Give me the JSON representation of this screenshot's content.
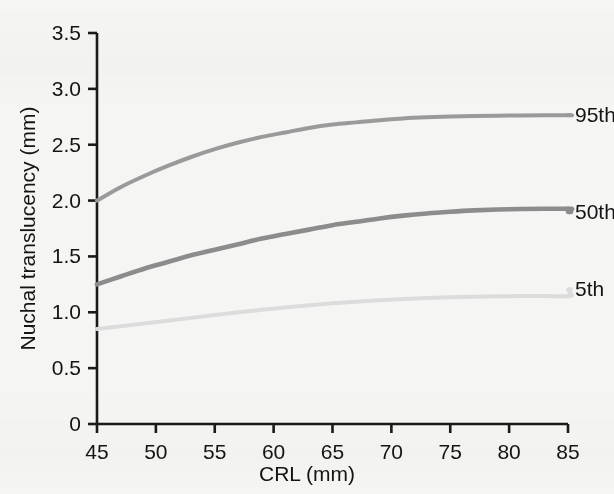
{
  "chart_data": {
    "type": "line",
    "title": "",
    "xlabel": "CRL (mm)",
    "ylabel": "Nuchal translucency (mm)",
    "xlim": [
      45,
      85
    ],
    "ylim": [
      0,
      3.5
    ],
    "xticks": [
      "45",
      "50",
      "55",
      "60",
      "65",
      "70",
      "75",
      "80",
      "85"
    ],
    "yticks": [
      "0",
      "0.5",
      "1.0",
      "1.5",
      "2.0",
      "2.5",
      "3.0",
      "3.5"
    ],
    "xtick_values": [
      45,
      50,
      55,
      60,
      65,
      70,
      75,
      80,
      85
    ],
    "ytick_values": [
      0,
      0.5,
      1.0,
      1.5,
      2.0,
      2.5,
      3.0,
      3.5
    ],
    "grid": false,
    "legend_position": "right-inline",
    "x": [
      45,
      47,
      49,
      51,
      53,
      55,
      57,
      59,
      61,
      63,
      65,
      67,
      69,
      71,
      73,
      75,
      77,
      79,
      81,
      83,
      85
    ],
    "series": [
      {
        "name": "95th",
        "label": "95th",
        "color": "#9a9a9a",
        "width": 4.0,
        "values": [
          2.0,
          2.12,
          2.22,
          2.31,
          2.39,
          2.46,
          2.52,
          2.57,
          2.61,
          2.65,
          2.68,
          2.7,
          2.72,
          2.735,
          2.745,
          2.752,
          2.757,
          2.76,
          2.762,
          2.763,
          2.763
        ]
      },
      {
        "name": "50th",
        "label": "50th",
        "color": "#8c8c8c",
        "width": 4.6,
        "values": [
          1.25,
          1.32,
          1.39,
          1.45,
          1.51,
          1.56,
          1.61,
          1.66,
          1.7,
          1.74,
          1.78,
          1.81,
          1.84,
          1.865,
          1.885,
          1.9,
          1.912,
          1.92,
          1.925,
          1.927,
          1.927
        ]
      },
      {
        "name": "5th",
        "label": "5th",
        "color": "#dcdcdc",
        "width": 4.0,
        "values": [
          0.85,
          0.875,
          0.9,
          0.925,
          0.95,
          0.975,
          1.0,
          1.022,
          1.043,
          1.062,
          1.08,
          1.095,
          1.108,
          1.119,
          1.128,
          1.135,
          1.14,
          1.143,
          1.145,
          1.145,
          1.143
        ]
      }
    ],
    "series_label_positions": [
      {
        "name": "95th",
        "x": 575,
        "y": 115
      },
      {
        "name": "50th",
        "x": 575,
        "y": 212
      },
      {
        "name": "5th",
        "x": 575,
        "y": 289
      }
    ]
  },
  "axes": {
    "plot_left_px": 97,
    "plot_right_px": 568,
    "plot_bottom_px": 424,
    "plot_top_px": 33,
    "axis_color": "#1a1a1a"
  }
}
